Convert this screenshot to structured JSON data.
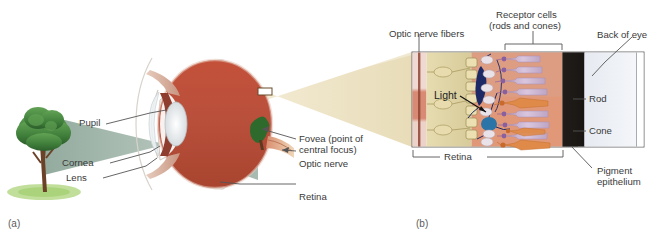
{
  "figure": {
    "panels": [
      {
        "id": "a",
        "label": "(a)",
        "caption": "Cross-section of the human eye"
      },
      {
        "id": "b",
        "label": "(b)",
        "caption": "Enlarged cross-section of the retina"
      }
    ]
  },
  "panel_a": {
    "label": "(a)",
    "labels": {
      "pupil": "Pupil",
      "cornea": "Cornea",
      "lens": "Lens",
      "fovea_line1": "Fovea (point of",
      "fovea_line2": "central focus)",
      "optic_nerve": "Optic nerve",
      "retina": "Retina"
    },
    "scene": {
      "object": "tree",
      "light_path": "Light from the tree passes through the cornea, pupil and lens and is projected inverted onto the retina"
    }
  },
  "panel_b": {
    "label": "(b)",
    "labels": {
      "optic_nerve_fibers": "Optic nerve fibers",
      "receptor_cells_line1": "Receptor cells",
      "receptor_cells_line2": "(rods and cones)",
      "back_of_eye": "Back of eye",
      "light": "Light",
      "rod": "Rod",
      "cone": "Cone",
      "pigment_line1": "Pigment",
      "pigment_line2": "epithelium",
      "retina_bracket": "Retina"
    },
    "layers": [
      "blood vessels",
      "optic nerve fiber layer",
      "ganglion cells",
      "bipolar cells",
      "rods and cones",
      "pigment epithelium",
      "back of eye"
    ]
  },
  "colors": {
    "eye_interior": "#b9503c",
    "eye_sclera": "#f4efe9",
    "light_cone": "#8fa79a",
    "tree_canopy": "#3f7f3b",
    "tree_trunk": "#6b4228",
    "ground": "#b6d98a",
    "magnifier_fan": "#ede2c2",
    "retina_cream": "#e3d9ae",
    "receptor_bg": "#e09878",
    "pigment_epithelium": "#231f1c",
    "back_of_eye": "#dde3ec",
    "rod": "#c3a6c8",
    "cone": "#e08a4a",
    "bipolar": "#1d2a66",
    "leader_line": "#555555",
    "label_text": "#3a3a3a"
  }
}
